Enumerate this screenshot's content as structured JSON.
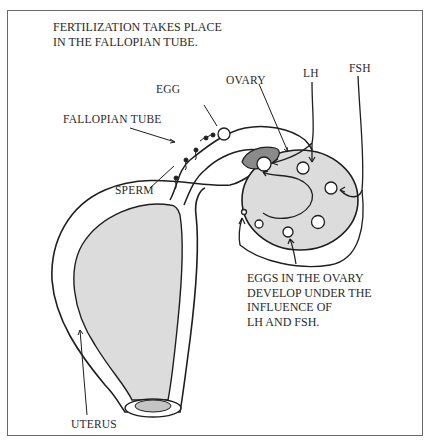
{
  "title": {
    "lines": [
      "FERTILIZATION TAKES PLACE",
      "IN THE FALLOPIAN TUBE."
    ]
  },
  "labels": {
    "egg": "EGG",
    "fallopian_tube": "FALLOPIAN TUBE",
    "sperm": "SPERM",
    "ovary": "OVARY",
    "lh": "LH",
    "fsh": "FSH",
    "uterus": "UTERUS"
  },
  "caption": {
    "lines": [
      "EGGS IN THE OVARY",
      "DEVELOP UNDER THE",
      "INFLUENCE OF",
      "LH AND FSH."
    ]
  },
  "colors": {
    "ink": "#1e1e1e",
    "organ_fill": "#dcdcdc",
    "dark_fill": "#8a8a8a",
    "frame": "#6a6a6a"
  }
}
